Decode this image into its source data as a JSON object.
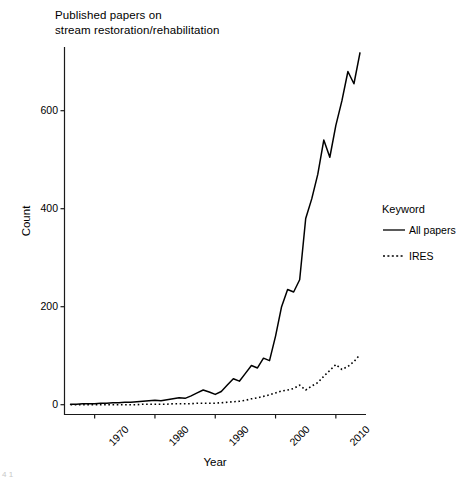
{
  "figure": {
    "title_line1": "Published papers on",
    "title_line2": "stream restoration/rehabilitation",
    "background_color": "#ffffff",
    "foreground_color": "#000000",
    "corner_artifact_text": "4 1"
  },
  "legend": {
    "title": "Keyword",
    "entries": [
      {
        "label": "All papers",
        "style": "solid",
        "key_name": "legend-key-all-papers"
      },
      {
        "label": "IRES",
        "style": "dotted",
        "key_name": "legend-key-ires"
      }
    ]
  },
  "axes": {
    "x": {
      "label": "Year",
      "ticks": [
        "1970",
        "1980",
        "1990",
        "2000",
        "2010"
      ],
      "tick_values": [
        1970,
        1980,
        1990,
        2000,
        2010
      ],
      "range": [
        1965,
        2015
      ]
    },
    "y": {
      "label": "Count",
      "ticks": [
        "0",
        "200",
        "400",
        "600"
      ],
      "tick_values": [
        0,
        200,
        400,
        600
      ],
      "range": [
        -20,
        730
      ]
    }
  },
  "chart_data": {
    "type": "line",
    "title": "Published papers on stream restoration/rehabilitation",
    "xlabel": "Year",
    "ylabel": "Count",
    "xlim": [
      1965,
      2015
    ],
    "ylim": [
      -20,
      730
    ],
    "grid": false,
    "legend_position": "right",
    "legend_title": "Keyword",
    "x": [
      1966,
      1967,
      1968,
      1969,
      1970,
      1971,
      1972,
      1973,
      1974,
      1975,
      1976,
      1977,
      1978,
      1979,
      1980,
      1981,
      1982,
      1983,
      1984,
      1985,
      1986,
      1987,
      1988,
      1989,
      1990,
      1991,
      1992,
      1993,
      1994,
      1995,
      1996,
      1997,
      1998,
      1999,
      2000,
      2001,
      2002,
      2003,
      2004,
      2005,
      2006,
      2007,
      2008,
      2009,
      2010,
      2011,
      2012,
      2013,
      2014
    ],
    "series": [
      {
        "name": "All papers",
        "style": "solid",
        "values": [
          1,
          1,
          2,
          2,
          2,
          3,
          3,
          4,
          4,
          5,
          5,
          6,
          7,
          8,
          9,
          8,
          10,
          12,
          14,
          13,
          18,
          24,
          30,
          26,
          21,
          27,
          40,
          53,
          48,
          64,
          80,
          75,
          95,
          90,
          140,
          200,
          235,
          230,
          255,
          380,
          420,
          470,
          540,
          505,
          570,
          620,
          680,
          655,
          718
        ]
      },
      {
        "name": "IRES",
        "style": "dotted",
        "values": [
          0,
          0,
          0,
          0,
          0,
          0,
          0,
          0,
          0,
          0,
          0,
          0,
          1,
          1,
          1,
          1,
          1,
          2,
          2,
          2,
          2,
          3,
          3,
          3,
          3,
          4,
          5,
          6,
          7,
          9,
          12,
          14,
          17,
          20,
          24,
          28,
          30,
          33,
          40,
          30,
          38,
          45,
          58,
          70,
          82,
          72,
          78,
          88,
          102
        ]
      }
    ]
  }
}
